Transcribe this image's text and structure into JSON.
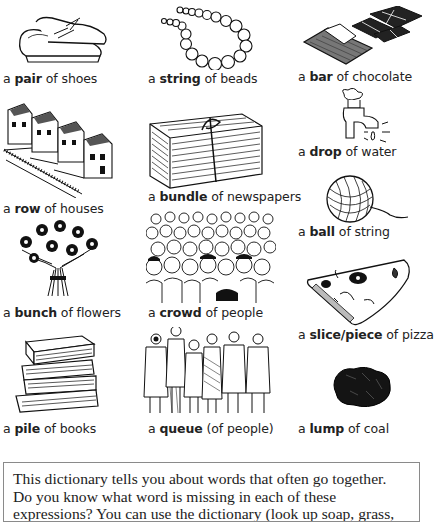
{
  "collocations": [
    {
      "id": "shoes",
      "prefix": "a ",
      "keyword": "pair",
      "suffix": " of shoes",
      "icon": "shoes-icon"
    },
    {
      "id": "beads",
      "prefix": "a ",
      "keyword": "string",
      "suffix": " of beads",
      "icon": "beads-icon"
    },
    {
      "id": "chocolate",
      "prefix": "a ",
      "keyword": "bar",
      "suffix": " of chocolate",
      "icon": "chocolate-icon"
    },
    {
      "id": "water",
      "prefix": "a ",
      "keyword": "drop",
      "suffix": " of water",
      "icon": "tap-drop-icon"
    },
    {
      "id": "houses",
      "prefix": "a ",
      "keyword": "row",
      "suffix": " of houses",
      "icon": "houses-icon"
    },
    {
      "id": "newspapers",
      "prefix": "a ",
      "keyword": "bundle",
      "suffix": " of newspapers",
      "icon": "newspapers-icon"
    },
    {
      "id": "string",
      "prefix": "a ",
      "keyword": "ball",
      "suffix": " of string",
      "icon": "ball-of-string-icon"
    },
    {
      "id": "flowers",
      "prefix": "a ",
      "keyword": "bunch",
      "suffix": " of flowers",
      "icon": "flowers-icon"
    },
    {
      "id": "people",
      "prefix": "a ",
      "keyword": "crowd",
      "suffix": " of people",
      "icon": "crowd-icon"
    },
    {
      "id": "pizza",
      "prefix": "a ",
      "keyword": "slice/piece",
      "suffix": " of pizza",
      "icon": "pizza-icon"
    },
    {
      "id": "books",
      "prefix": "a ",
      "keyword": "pile",
      "suffix": " of books",
      "icon": "books-icon"
    },
    {
      "id": "queue",
      "prefix": "a ",
      "keyword": "queue",
      "suffix": " (of people)",
      "icon": "queue-icon"
    },
    {
      "id": "coal",
      "prefix": "a ",
      "keyword": "lump",
      "suffix": " of coal",
      "icon": "coal-icon"
    }
  ],
  "info_box": {
    "lines": [
      "This dictionary tells you about words that often go together.",
      "Do you know what word is missing in each of these",
      "expressions? You can use the dictionary (look up soap, grass,"
    ]
  },
  "colors": {
    "text": "#222222",
    "box_border": "#8a8a8a",
    "ink": "#1a1a1a"
  }
}
